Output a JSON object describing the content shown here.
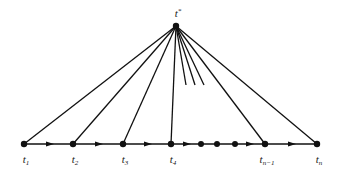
{
  "diagram": {
    "title": "",
    "apex": {
      "label": "t",
      "sup": "*",
      "x": 176,
      "y": 26
    },
    "baseline_y": 144,
    "baseline": {
      "x1": 24,
      "x2": 317
    },
    "nodes": [
      {
        "id": "t1",
        "label": "t",
        "sub": "1",
        "x": 24
      },
      {
        "id": "t2",
        "label": "t",
        "sub": "2",
        "x": 73
      },
      {
        "id": "t3",
        "label": "t",
        "sub": "3",
        "x": 123
      },
      {
        "id": "t4",
        "label": "t",
        "sub": "4",
        "x": 171
      },
      {
        "id": "tn-1",
        "label": "t",
        "sub": "n−1",
        "x": 265
      },
      {
        "id": "tn",
        "label": "t",
        "sub": "n",
        "x": 317
      }
    ],
    "intermediate_dots": [
      201,
      217,
      235
    ],
    "arrows": [
      50,
      99,
      148,
      187,
      250,
      292
    ],
    "partial_edges": [
      {
        "x2": 186,
        "y2": 85
      },
      {
        "x2": 195,
        "y2": 85
      },
      {
        "x2": 204,
        "y2": 85
      }
    ],
    "colors": {
      "stroke": "#111111",
      "background": "#ffffff"
    }
  }
}
